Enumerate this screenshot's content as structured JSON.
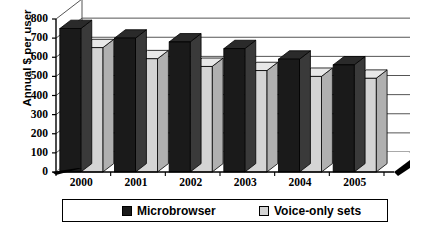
{
  "chart_data": {
    "type": "bar",
    "title": "",
    "subtitle": "",
    "xlabel": "",
    "ylabel": "Annual $ per user",
    "categories": [
      "2000",
      "2001",
      "2002",
      "2003",
      "2004",
      "2005"
    ],
    "series": [
      {
        "name": "Microbrowser",
        "color": "#1a1a1a",
        "values": [
          750,
          700,
          680,
          645,
          590,
          560
        ]
      },
      {
        "name": "Voice-only sets",
        "color": "#d4d4d4",
        "values": [
          650,
          592,
          552,
          530,
          500,
          490
        ]
      }
    ],
    "ylim": [
      0,
      800
    ],
    "yticks": [
      800,
      700,
      600,
      500,
      400,
      300,
      200,
      100,
      0
    ],
    "ytick_labels": [
      "800",
      "700",
      "600",
      "500",
      "400",
      "300",
      "200",
      "100",
      "0"
    ],
    "grid": true,
    "grid_orientation": "horizontal",
    "legend_position": "bottom",
    "style": "3d-column"
  },
  "legend": {
    "entries": [
      {
        "label": "Microbrowser",
        "swatch_color": "#1a1a1a"
      },
      {
        "label": "Voice-only sets",
        "swatch_color": "#d4d4d4"
      }
    ]
  },
  "colors": {
    "series_black": "#1a1a1a",
    "series_gray": "#d4d4d4",
    "axis": "#000000",
    "gridline": "#555555",
    "background": "#ffffff"
  }
}
